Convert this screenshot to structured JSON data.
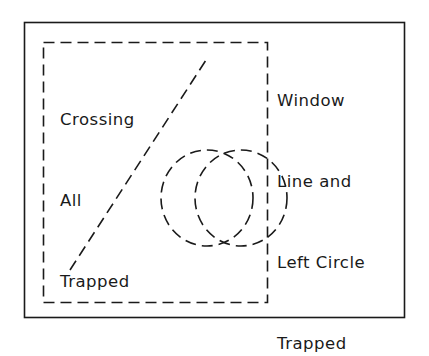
{
  "labels": {
    "crossing": [
      "Crossing",
      "All",
      "Trapped"
    ],
    "window": [
      "Window",
      "Line and",
      "Left Circle",
      "Trapped"
    ]
  },
  "colors": {
    "stroke": "#1a1a1a",
    "background": "#ffffff"
  }
}
